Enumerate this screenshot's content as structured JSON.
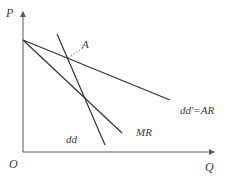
{
  "diagram": {
    "axes": {
      "y_label": "P",
      "x_label": "Q",
      "origin_label": "O"
    },
    "curves": [
      {
        "id": "dd_prime_AR",
        "label": "dd'=AR",
        "x1": 23,
        "y1": 40,
        "x2": 170,
        "y2": 100
      },
      {
        "id": "MR",
        "label": "MR",
        "x1": 23,
        "y1": 40,
        "x2": 122,
        "y2": 133
      },
      {
        "id": "dd",
        "label": "dd",
        "x1": 57,
        "y1": 34,
        "x2": 105,
        "y2": 145
      }
    ],
    "points": [
      {
        "id": "A",
        "label": "A",
        "x": 68,
        "y": 58
      }
    ],
    "colors": {
      "line": "#333333",
      "axis": "#5a5a5a",
      "text": "#3a3a3a"
    }
  }
}
